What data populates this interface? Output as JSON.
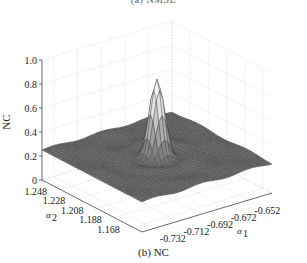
{
  "chart_data": {
    "type": "surface3d",
    "top_caption": "(a) NMSE",
    "title": "(b) NC",
    "zlabel": "NC",
    "xlabel": "α1",
    "ylabel": "α2",
    "zlim": [
      0,
      1.0
    ],
    "z_ticks": [
      "0",
      "0.2",
      "0.4",
      "0.6",
      "0.8",
      "1.0"
    ],
    "x_ticks": [
      "-0.732",
      "-0.712",
      "-0.692",
      "-0.672",
      "-0.652"
    ],
    "y_ticks": [
      "1.248",
      "1.228",
      "1.208",
      "1.188",
      "1.168"
    ],
    "xlim": [
      -0.742,
      -0.642
    ],
    "ylim": [
      1.158,
      1.258
    ],
    "grid": true,
    "peak": {
      "alpha1": -0.692,
      "alpha2": 1.208,
      "nc": 0.86
    },
    "baseline_nc": 0.25
  }
}
